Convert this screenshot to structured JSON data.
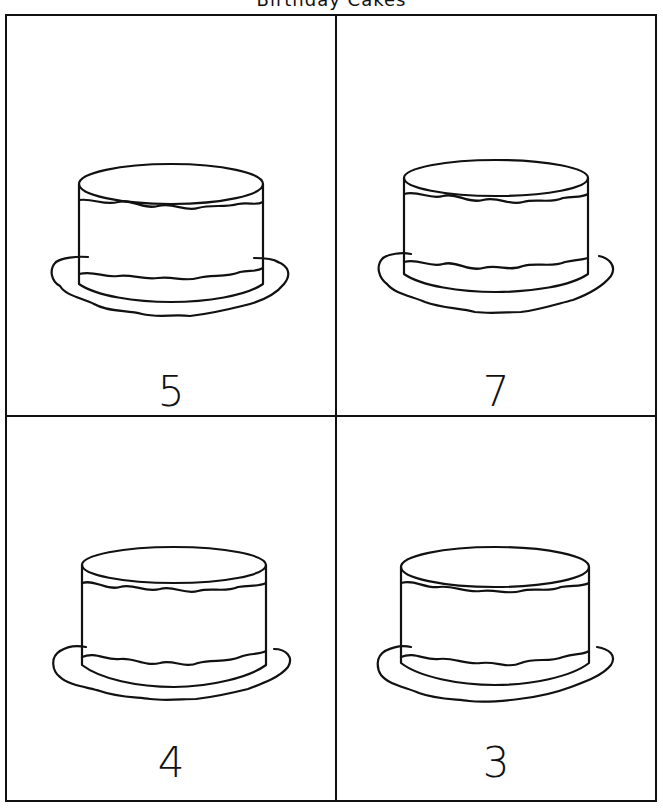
{
  "worksheet": {
    "title": "Birthday Cakes",
    "cells": [
      {
        "number": "5",
        "picture": "birthday-cake"
      },
      {
        "number": "7",
        "picture": "birthday-cake"
      },
      {
        "number": "4",
        "picture": "birthday-cake"
      },
      {
        "number": "3",
        "picture": "birthday-cake"
      }
    ],
    "colors": {
      "line": "#111111",
      "background": "#ffffff"
    }
  }
}
